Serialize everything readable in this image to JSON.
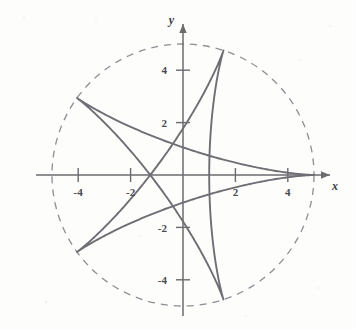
{
  "figure": {
    "kind": "math-plot",
    "background_color": "#fdfdfb",
    "curve_color": "#6e6e74",
    "axis_color": "#6b6b70",
    "circle_color": "#8e8e95"
  },
  "axes": {
    "x_axis_label": "x",
    "y_axis_label": "y",
    "x_ticks": [
      {
        "value": -4,
        "label": "-4"
      },
      {
        "value": -2,
        "label": "-2"
      },
      {
        "value": 2,
        "label": "2"
      },
      {
        "value": 4,
        "label": "4"
      }
    ],
    "y_ticks": [
      {
        "value": 4,
        "label": "4"
      },
      {
        "value": 2,
        "label": "2"
      },
      {
        "value": -2,
        "label": "-2"
      },
      {
        "value": -4,
        "label": "-4"
      }
    ]
  },
  "chart_data": {
    "type": "line",
    "title": "",
    "subtitle": "",
    "xlabel": "x",
    "ylabel": "y",
    "xlim": [
      -5.6,
      5.9
    ],
    "ylim": [
      -5.6,
      5.6
    ],
    "grid": false,
    "legend": "none",
    "aspect": "equal",
    "annotations": [],
    "series": [
      {
        "name": "bounding circle",
        "type": "circle",
        "style": "dashed",
        "center": [
          0,
          0
        ],
        "radius": 5,
        "color": "#8e8e95"
      },
      {
        "name": "five-cusped hypocycloid (star curve)",
        "type": "parametric-closed",
        "style": "solid",
        "color": "#6e6e74",
        "cusp_count": 5,
        "cusp_radius": 5,
        "cusps": [
          {
            "angle_deg": 0,
            "x": 5.0,
            "y": 0.0
          },
          {
            "angle_deg": 72,
            "x": 1.55,
            "y": 4.76
          },
          {
            "angle_deg": 144,
            "x": -4.05,
            "y": 2.94
          },
          {
            "angle_deg": 216,
            "x": -4.05,
            "y": -2.94
          },
          {
            "angle_deg": 288,
            "x": 1.55,
            "y": -4.76
          }
        ],
        "description": "Hypocycloid with 5 cusps traced by rolling circle, ratio 5/2; each arc spans two cusps producing a pentagram-like star with slightly bowed edges."
      }
    ]
  }
}
